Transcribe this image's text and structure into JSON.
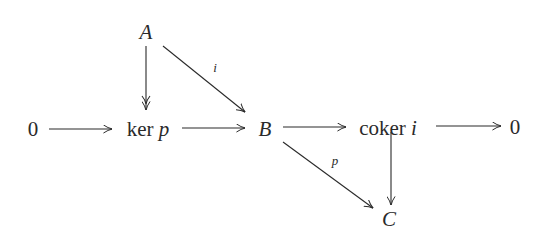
{
  "diagram": {
    "type": "commutative-diagram",
    "nodes": {
      "zero_left": {
        "text": "0",
        "x": 33,
        "y": 129
      },
      "A": {
        "text": "A",
        "x": 146,
        "y": 32
      },
      "ker_p": {
        "op": "ker",
        "var": "p",
        "x": 148,
        "y": 129
      },
      "B": {
        "text": "B",
        "x": 265,
        "y": 129
      },
      "coker_i": {
        "op": "coker",
        "var": "i",
        "x": 386,
        "y": 128
      },
      "zero_right": {
        "text": "0",
        "x": 515,
        "y": 127
      },
      "C": {
        "text": "C",
        "x": 388,
        "y": 219
      }
    },
    "edges": [
      {
        "from": "0",
        "to": "ker p",
        "label": ""
      },
      {
        "from": "ker p",
        "to": "B",
        "label": ""
      },
      {
        "from": "B",
        "to": "coker i",
        "label": ""
      },
      {
        "from": "coker i",
        "to": "0",
        "label": ""
      },
      {
        "from": "A",
        "to": "ker p",
        "label": "",
        "style": "double-head"
      },
      {
        "from": "A",
        "to": "B",
        "label": "i"
      },
      {
        "from": "B",
        "to": "C",
        "label": "p"
      },
      {
        "from": "coker i",
        "to": "C",
        "label": ""
      }
    ],
    "labels": {
      "i": "i",
      "p": "p"
    }
  },
  "colors": {
    "ink": "#2a2a2a",
    "background": "#ffffff"
  }
}
